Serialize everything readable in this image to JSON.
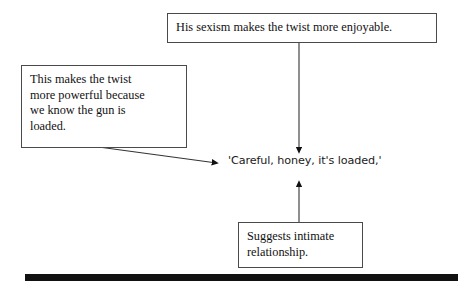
{
  "page": {
    "type": "annotated-text-diagram",
    "background_color": "#ffffff",
    "text_color": "#111111",
    "rule_color": "#111111"
  },
  "quote": {
    "text": "'Careful, honey, it's loaded,'"
  },
  "annotations": [
    {
      "id": "top",
      "text": "His sexism makes the twist more enjoyable."
    },
    {
      "id": "left",
      "text": "This makes the twist\nmore powerful because\nwe know the gun is\nloaded."
    },
    {
      "id": "bottom",
      "text": "Suggests intimate\nrelationship."
    }
  ],
  "connectors": [
    {
      "id": "top-to-quote",
      "name": "arrow-down-from-top-note",
      "direction": "down",
      "from": [
        299,
        43
      ],
      "to": [
        299,
        155
      ]
    },
    {
      "id": "left-to-quote",
      "name": "arrow-diagonal-from-left-note",
      "direction": "right-down",
      "from": [
        95,
        146
      ],
      "to": [
        220,
        163
      ]
    },
    {
      "id": "bottom-to-quote",
      "name": "arrow-up-from-bottom-note",
      "direction": "up",
      "from": [
        299,
        222
      ],
      "to": [
        299,
        178
      ]
    }
  ],
  "footer_rule": {
    "label": "solid-black-rule"
  }
}
